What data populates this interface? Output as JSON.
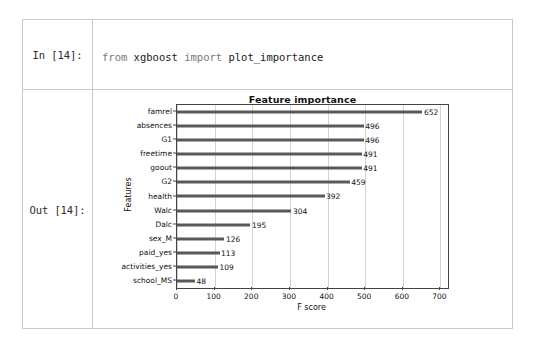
{
  "notebook": {
    "input_prompt": "In [14]:",
    "output_prompt": "Out [14]:",
    "code_lines": [
      {
        "keyword1": "from",
        "text1": " xgboost ",
        "keyword2": "import",
        "text2": " plot_importance"
      },
      {
        "keyword1": "",
        "text1": "plot_importance(xgb)",
        "keyword2": "",
        "text2": ""
      }
    ],
    "code_full_line_1": "from xgboost import plot_importance",
    "code_full_line_2": "plot_importance(xgb)"
  },
  "chart_data": {
    "type": "bar",
    "orientation": "horizontal",
    "title": "Feature importance",
    "xlabel": "F score",
    "ylabel": "Features",
    "xlim": [
      0,
      720
    ],
    "xticks": [
      0,
      100,
      200,
      300,
      400,
      500,
      600,
      700
    ],
    "grid": true,
    "legend": null,
    "categories": [
      "famrel",
      "absences",
      "G1",
      "freetime",
      "goout",
      "G2",
      "health",
      "Walc",
      "Dalc",
      "sex_M",
      "paid_yes",
      "activities_yes",
      "school_MS"
    ],
    "values": [
      652,
      496,
      496,
      491,
      491,
      459,
      392,
      304,
      195,
      126,
      113,
      109,
      48
    ],
    "bar_color": "#595959",
    "value_labels": [
      "652",
      "496",
      "496",
      "491",
      "491",
      "459",
      "392",
      "304",
      "195",
      "126",
      "113",
      "109",
      "48"
    ]
  }
}
